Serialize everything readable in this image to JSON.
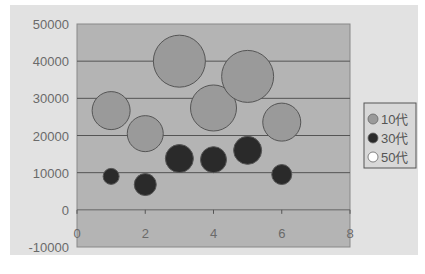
{
  "chart_data": {
    "type": "bubble",
    "title": "",
    "xlabel": "",
    "ylabel": "",
    "xlim": [
      0,
      8
    ],
    "ylim": [
      -10000,
      50000
    ],
    "x_ticks": [
      0,
      2,
      4,
      6,
      8
    ],
    "y_ticks": [
      -10000,
      0,
      10000,
      20000,
      30000,
      40000,
      50000
    ],
    "grid": "horizontal",
    "legend_position": "right",
    "series": [
      {
        "name": "10代",
        "color": "#9a9a9a",
        "points": [
          {
            "x": 1,
            "y": 26700,
            "size": 19
          },
          {
            "x": 2,
            "y": 20500,
            "size": 18
          },
          {
            "x": 3,
            "y": 40000,
            "size": 26
          },
          {
            "x": 4,
            "y": 27400,
            "size": 23
          },
          {
            "x": 5,
            "y": 35900,
            "size": 26
          },
          {
            "x": 6,
            "y": 23600,
            "size": 19
          }
        ]
      },
      {
        "name": "30代",
        "color": "#2a2a2a",
        "points": [
          {
            "x": 1,
            "y": 9000,
            "size": 8
          },
          {
            "x": 2,
            "y": 6800,
            "size": 11
          },
          {
            "x": 3,
            "y": 13800,
            "size": 14
          },
          {
            "x": 4,
            "y": 13500,
            "size": 13
          },
          {
            "x": 5,
            "y": 16000,
            "size": 14
          },
          {
            "x": 6,
            "y": 9500,
            "size": 10
          }
        ]
      },
      {
        "name": "50代",
        "color": "#ffffff",
        "points": []
      }
    ]
  },
  "legend": {
    "items": [
      {
        "label": "10代",
        "color": "#9a9a9a"
      },
      {
        "label": "30代",
        "color": "#2a2a2a"
      },
      {
        "label": "50代",
        "color": "#ffffff"
      }
    ]
  }
}
